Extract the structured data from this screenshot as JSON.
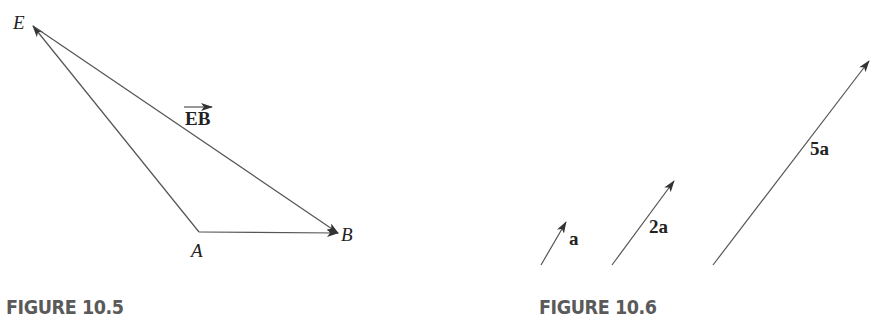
{
  "figures": [
    {
      "caption": "FIGURE 10.5",
      "points": {
        "E": "E",
        "A": "A",
        "B": "B"
      },
      "vector_label": "EB"
    },
    {
      "caption": "FIGURE 10.6",
      "vectors": [
        {
          "label": "a"
        },
        {
          "label": "2a"
        },
        {
          "label": "5a"
        }
      ]
    }
  ],
  "colors": {
    "line": "#555555",
    "text": "#222222",
    "caption": "#5a5a5a"
  }
}
